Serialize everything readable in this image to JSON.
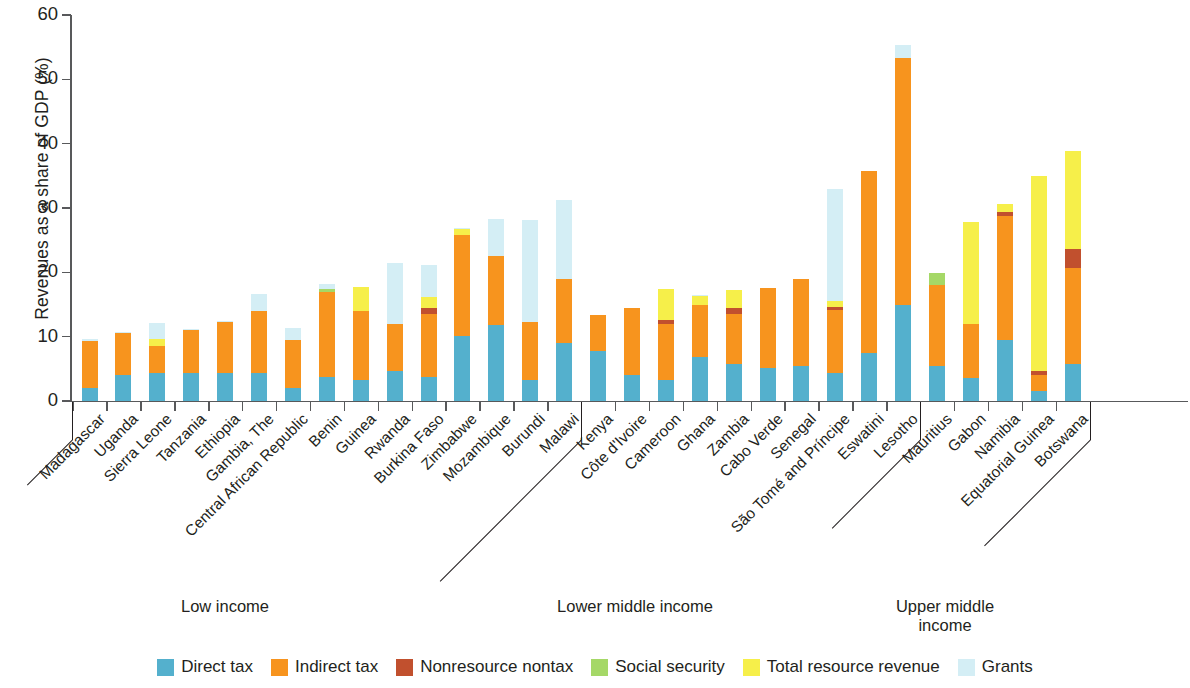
{
  "chart_data": {
    "type": "bar",
    "subtype": "stacked",
    "title": "",
    "xlabel": "",
    "ylabel": "Revenues as a share of GDP (%)",
    "ylim": [
      0,
      60
    ],
    "yticks": [
      0,
      10,
      20,
      30,
      40,
      50,
      60
    ],
    "grid": false,
    "legend_position": "bottom",
    "series": [
      {
        "name": "Direct tax",
        "color": "#54b0cd"
      },
      {
        "name": "Indirect tax",
        "color": "#f7941e"
      },
      {
        "name": "Nonresource nontax",
        "color": "#c1502e"
      },
      {
        "name": "Social security",
        "color": "#a5d867"
      },
      {
        "name": "Total resource revenue",
        "color": "#f6ef4a"
      },
      {
        "name": "Grants",
        "color": "#d4eef5"
      }
    ],
    "categories": [
      "Madagascar",
      "Uganda",
      "Sierra Leone",
      "Tanzania",
      "Ethiopia",
      "Gambia, The",
      "Central African Republic",
      "Benin",
      "Guinea",
      "Rwanda",
      "Burkina Faso",
      "Zimbabwe",
      "Mozambique",
      "Burundi",
      "Malawi",
      "Kenya",
      "Côte d'Ivoire",
      "Cameroon",
      "Ghana",
      "Zambia",
      "Cabo Verde",
      "Senegal",
      "São Tomé and Príncipe",
      "Eswatini",
      "Lesotho",
      "Mauritius",
      "Gabon",
      "Namibia",
      "Equatorial Guinea",
      "Botswana"
    ],
    "values": {
      "Direct tax": [
        2.1,
        4.0,
        4.3,
        4.4,
        4.3,
        4.4,
        2.1,
        3.7,
        3.2,
        4.6,
        3.7,
        10.1,
        11.8,
        3.3,
        9.0,
        7.8,
        4.0,
        3.2,
        6.9,
        5.7,
        5.2,
        5.4,
        4.4,
        7.5,
        14.9,
        5.4,
        3.6,
        9.5,
        1.6,
        5.7
      ],
      "Indirect tax": [
        7.2,
        6.5,
        4.3,
        6.6,
        8.0,
        9.6,
        7.4,
        13.2,
        10.8,
        7.4,
        9.9,
        15.7,
        10.8,
        9.0,
        9.9,
        5.6,
        10.5,
        8.8,
        8.0,
        7.8,
        12.3,
        13.5,
        9.7,
        28.2,
        38.4,
        12.6,
        8.4,
        19.3,
        2.4,
        14.9
      ],
      "Nonresource nontax": [
        0,
        0,
        0,
        0,
        0,
        0,
        0,
        0,
        0,
        0,
        0.9,
        0,
        0,
        0,
        0,
        0,
        0,
        0.6,
        0,
        0.9,
        0,
        0,
        0.5,
        0,
        0,
        0,
        0,
        0.6,
        0.6,
        3.0
      ],
      "Social security": [
        0,
        0,
        0,
        0,
        0,
        0,
        0,
        0.5,
        0,
        0,
        0,
        0,
        0,
        0,
        0,
        0,
        0,
        0,
        0,
        0,
        0,
        0,
        0,
        0,
        0,
        1.9,
        0,
        0,
        0,
        0
      ],
      "Total resource revenue": [
        0,
        0,
        1.0,
        0,
        0,
        0,
        0,
        0,
        3.8,
        0,
        1.6,
        1.0,
        0,
        0,
        0,
        0,
        0,
        4.8,
        1.5,
        2.9,
        0,
        0,
        0.9,
        0,
        0,
        0,
        15.8,
        1.3,
        30.4,
        15.2
      ],
      "Grants": [
        0.4,
        0.3,
        2.5,
        0.2,
        0.2,
        2.6,
        1.8,
        0.8,
        0,
        9.5,
        5.0,
        0.1,
        5.7,
        15.9,
        12.3,
        0,
        0,
        0,
        0.1,
        0,
        0,
        0,
        17.4,
        0,
        2.0,
        0,
        0,
        0,
        0,
        0
      ]
    },
    "group_brackets": [
      {
        "label": "Low income",
        "from": "Madagascar",
        "to": "Malawi"
      },
      {
        "label": "Lower middle income",
        "from": "Kenya",
        "to": "Lesotho"
      },
      {
        "label": "Upper middle\nincome",
        "from": "Mauritius",
        "to": "Botswana"
      }
    ]
  },
  "axis": {
    "y_title": "Revenues as a share of GDP (%)",
    "y_ticks": [
      "60",
      "50",
      "40",
      "30",
      "20",
      "10",
      "0"
    ]
  },
  "legend": {
    "items": [
      {
        "label": "Direct tax",
        "color": "#54b0cd"
      },
      {
        "label": "Indirect tax",
        "color": "#f7941e"
      },
      {
        "label": "Nonresource nontax",
        "color": "#c1502e"
      },
      {
        "label": "Social security",
        "color": "#a5d867"
      },
      {
        "label": "Total resource revenue",
        "color": "#f6ef4a"
      },
      {
        "label": "Grants",
        "color": "#d4eef5"
      }
    ]
  },
  "groups": {
    "low": "Low income",
    "lower_middle": "Lower middle income",
    "upper_middle_line1": "Upper middle",
    "upper_middle_line2": "income"
  }
}
